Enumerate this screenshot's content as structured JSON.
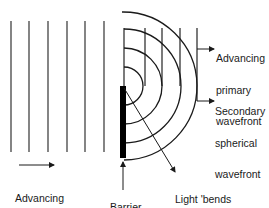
{
  "diagram": {
    "labels": {
      "primary": [
        "Advancing",
        "primary",
        "wavefront"
      ],
      "secondary": [
        "Secondary",
        "spherical",
        "wavefront"
      ],
      "advancing": [
        "Advancing",
        "wavefront"
      ],
      "barrier": [
        "Barrier"
      ],
      "light_bends": [
        "Light 'bends",
        "around the",
        "corner'"
      ]
    },
    "colors": {
      "line": "#1a1a1a",
      "barrier": "#000000",
      "background": "#ffffff"
    }
  }
}
